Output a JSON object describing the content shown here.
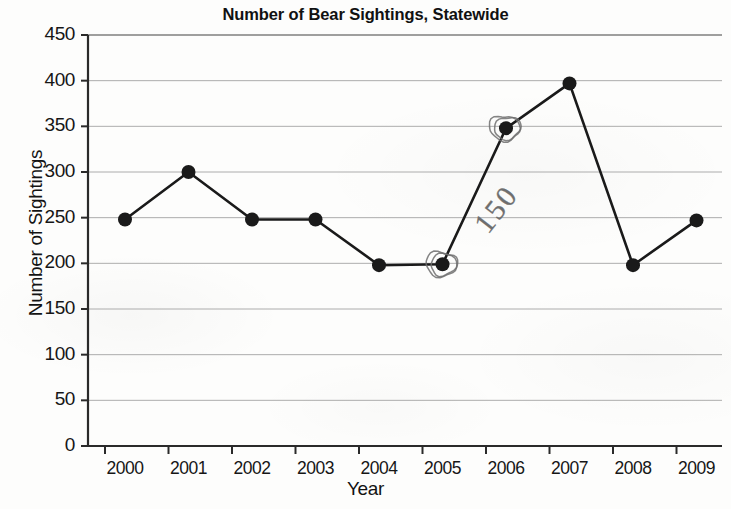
{
  "chart_data": {
    "type": "line",
    "title": "Number of Bear Sightings, Statewide",
    "xlabel": "Year",
    "ylabel": "Number of Sightings",
    "categories": [
      "2000",
      "2001",
      "2002",
      "2003",
      "2004",
      "2005",
      "2006",
      "2007",
      "2008",
      "2009"
    ],
    "values": [
      248,
      300,
      248,
      248,
      198,
      199,
      348,
      397,
      198,
      247
    ],
    "series": [
      {
        "name": "Number of Sightings",
        "values": [
          248,
          300,
          248,
          248,
          198,
          199,
          348,
          397,
          198,
          247
        ]
      }
    ],
    "ylim": [
      0,
      450
    ],
    "ytick_labels": [
      "0",
      "50",
      "100",
      "150",
      "200",
      "250",
      "300",
      "350",
      "400",
      "450"
    ],
    "ytick_values": [
      0,
      50,
      100,
      150,
      200,
      250,
      300,
      350,
      400,
      450
    ],
    "xtick_labels": [
      "2000",
      "2001",
      "2002",
      "2003",
      "2004",
      "2005",
      "2006",
      "2007",
      "2008",
      "2009"
    ],
    "grid": true,
    "legend": "none",
    "marker": "filled-circle",
    "line_color": "#1a1a1a",
    "marker_color": "#1a1a1a",
    "grid_color": "#9a9a9a",
    "annotations": [
      {
        "name": "handwritten-value",
        "text": "150",
        "style": "pencil-handwriting",
        "rotation_degrees": -52,
        "note": "written between the circled 2005 and 2006 markers"
      },
      {
        "name": "circled-point-2005",
        "text": "",
        "style": "pencil-circle",
        "target_category": "2005",
        "target_value": 199
      },
      {
        "name": "circled-point-2006",
        "text": "",
        "style": "pencil-circle",
        "target_category": "2006",
        "target_value": 348
      }
    ]
  },
  "colors": {
    "ink": "#1a1a1a",
    "grid": "#9a9a9a",
    "pencil": "#6e6e6e",
    "paper": "#fdfdfc"
  }
}
